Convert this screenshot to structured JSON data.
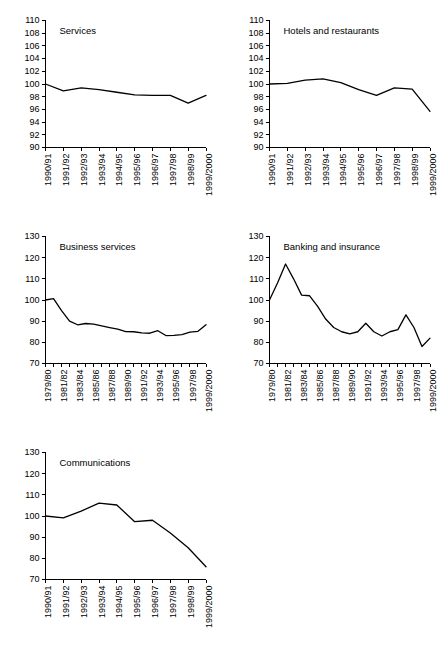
{
  "page": {
    "background_color": "#ffffff",
    "line_color": "#000000",
    "text_color": "#000000",
    "layout": "five line charts, two columns, three rows (last row single chart)"
  },
  "chart_data": [
    {
      "id": "services",
      "type": "line",
      "title": "Services",
      "xlabel": "",
      "ylabel": "",
      "ylim": [
        90,
        110
      ],
      "yticks": [
        90,
        92,
        94,
        96,
        98,
        100,
        102,
        104,
        106,
        108,
        110
      ],
      "grid": false,
      "legend": "none",
      "categories": [
        "1990/91",
        "1991/92",
        "1992/93",
        "1993/94",
        "1994/95",
        "1995/96",
        "1996/97",
        "1997/98",
        "1998/99",
        "1999/2000"
      ],
      "tick_labels": [
        "1990/91",
        "1991/92",
        "1992/93",
        "1993/94",
        "1994/95",
        "1995/96",
        "1996/97",
        "1997/98",
        "1998/99",
        "1999/2000"
      ],
      "values": [
        100.0,
        98.9,
        99.4,
        99.1,
        98.7,
        98.3,
        98.2,
        98.2,
        97.0,
        98.2
      ]
    },
    {
      "id": "hotels-and-restaurants",
      "type": "line",
      "title": "Hotels and restaurants",
      "xlabel": "",
      "ylabel": "",
      "ylim": [
        90,
        110
      ],
      "yticks": [
        90,
        92,
        94,
        96,
        98,
        100,
        102,
        104,
        106,
        108,
        110
      ],
      "grid": false,
      "legend": "none",
      "categories": [
        "1990/91",
        "1991/92",
        "1992/93",
        "1993/94",
        "1994/95",
        "1995/96",
        "1996/97",
        "1997/98",
        "1998/99",
        "1999/2000"
      ],
      "tick_labels": [
        "1990/91",
        "1991/92",
        "1992/93",
        "1993/94",
        "1994/95",
        "1995/96",
        "1996/97",
        "1997/98",
        "1998/99",
        "1999/2000"
      ],
      "values": [
        100.0,
        100.1,
        100.6,
        100.8,
        100.2,
        99.1,
        98.2,
        99.4,
        99.2,
        95.7
      ]
    },
    {
      "id": "business-services",
      "type": "line",
      "title": "Business services",
      "xlabel": "",
      "ylabel": "",
      "ylim": [
        70,
        130
      ],
      "yticks": [
        70,
        80,
        90,
        100,
        110,
        120,
        130
      ],
      "grid": false,
      "legend": "none",
      "categories": [
        "1979/80",
        "1980/81",
        "1981/82",
        "1982/83",
        "1983/84",
        "1984/85",
        "1985/86",
        "1986/87",
        "1987/88",
        "1988/89",
        "1989/90",
        "1990/91",
        "1991/92",
        "1992/93",
        "1993/94",
        "1994/95",
        "1995/96",
        "1996/97",
        "1997/98",
        "1998/99",
        "1999/2000"
      ],
      "tick_labels": [
        "1979/80",
        "1981/82",
        "1983/84",
        "1985/86",
        "1987/88",
        "1989/90",
        "1991/92",
        "1993/94",
        "1995/96",
        "1997/98",
        "1999/2000"
      ],
      "tick_label_every": 2,
      "values": [
        100.0,
        100.6,
        95.0,
        90.0,
        88.3,
        88.9,
        88.6,
        87.8,
        87.0,
        86.2,
        85.1,
        85.0,
        84.5,
        84.3,
        85.5,
        83.2,
        83.3,
        83.6,
        84.8,
        85.2,
        88.3
      ]
    },
    {
      "id": "banking-and-insurance",
      "type": "line",
      "title": "Banking and insurance",
      "xlabel": "",
      "ylabel": "",
      "ylim": [
        70,
        130
      ],
      "yticks": [
        70,
        80,
        90,
        100,
        110,
        120,
        130
      ],
      "grid": false,
      "legend": "none",
      "categories": [
        "1979/80",
        "1980/81",
        "1981/82",
        "1982/83",
        "1983/84",
        "1984/85",
        "1985/86",
        "1986/87",
        "1987/88",
        "1988/89",
        "1989/90",
        "1990/91",
        "1991/92",
        "1992/93",
        "1993/94",
        "1994/95",
        "1995/96",
        "1996/97",
        "1997/98",
        "1998/99",
        "1999/2000"
      ],
      "tick_labels": [
        "1979/80",
        "1981/82",
        "1983/84",
        "1985/86",
        "1987/88",
        "1989/90",
        "1991/92",
        "1993/94",
        "1995/96",
        "1997/98",
        "1999/2000"
      ],
      "tick_label_every": 2,
      "values": [
        100.0,
        108.0,
        117.0,
        110.0,
        102.3,
        102.0,
        97.0,
        91.0,
        87.0,
        85.0,
        84.0,
        85.0,
        89.0,
        85.0,
        83.0,
        85.0,
        86.0,
        93.0,
        87.0,
        78.0,
        82.0
      ]
    },
    {
      "id": "communications",
      "type": "line",
      "title": "Communications",
      "xlabel": "",
      "ylabel": "",
      "ylim": [
        70,
        130
      ],
      "yticks": [
        70,
        80,
        90,
        100,
        110,
        120,
        130
      ],
      "grid": false,
      "legend": "none",
      "categories": [
        "1990/91",
        "1991/92",
        "1992/93",
        "1993/94",
        "1994/95",
        "1995/96",
        "1996/97",
        "1997/98",
        "1998/99",
        "1999/2000"
      ],
      "tick_labels": [
        "1990/91",
        "1991/92",
        "1992/93",
        "1993/94",
        "1994/95",
        "1995/96",
        "1996/97",
        "1997/98",
        "1998/99",
        "1999/2000"
      ],
      "values": [
        100.0,
        99.1,
        102.3,
        106.1,
        105.2,
        97.3,
        98.0,
        92.0,
        85.0,
        76.0
      ]
    }
  ]
}
